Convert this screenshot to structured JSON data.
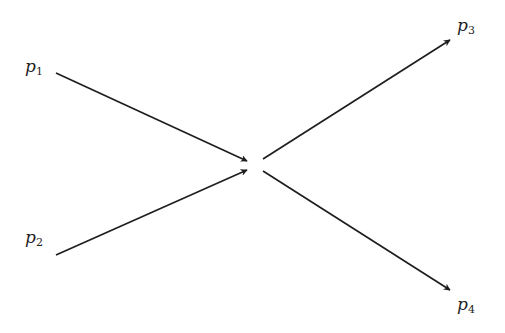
{
  "diagram": {
    "type": "feynman-like scattering diagram",
    "particles": [
      {
        "id": "p1",
        "base": "p",
        "subscript": "1",
        "direction": "incoming",
        "label_pos": [
          25,
          72
        ],
        "line": [
          56,
          73,
          247,
          161
        ]
      },
      {
        "id": "p2",
        "base": "p",
        "subscript": "2",
        "direction": "incoming",
        "label_pos": [
          25,
          243
        ],
        "line": [
          56,
          255,
          247,
          170
        ]
      },
      {
        "id": "p3",
        "base": "p",
        "subscript": "3",
        "direction": "outgoing",
        "label_pos": [
          457,
          31
        ],
        "line": [
          263,
          159,
          450,
          40
        ]
      },
      {
        "id": "p4",
        "base": "p",
        "subscript": "4",
        "direction": "outgoing",
        "label_pos": [
          457,
          310
        ],
        "line": [
          263,
          171,
          450,
          290
        ]
      }
    ],
    "colors": {
      "ink": "#1e1e1e",
      "background": "#ffffff"
    }
  }
}
